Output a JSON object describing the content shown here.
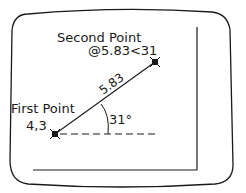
{
  "diagram": {
    "second_point": {
      "label": "Second Point",
      "coords": "@5.83<31"
    },
    "first_point": {
      "label": "First Point",
      "coords": "4,3"
    },
    "distance_label": "5.83",
    "angle_label": "31°",
    "colors": {
      "stroke": "#1a1a1a",
      "background": "#ffffff"
    },
    "icons": {
      "point_marker": "x-marker-icon"
    }
  }
}
